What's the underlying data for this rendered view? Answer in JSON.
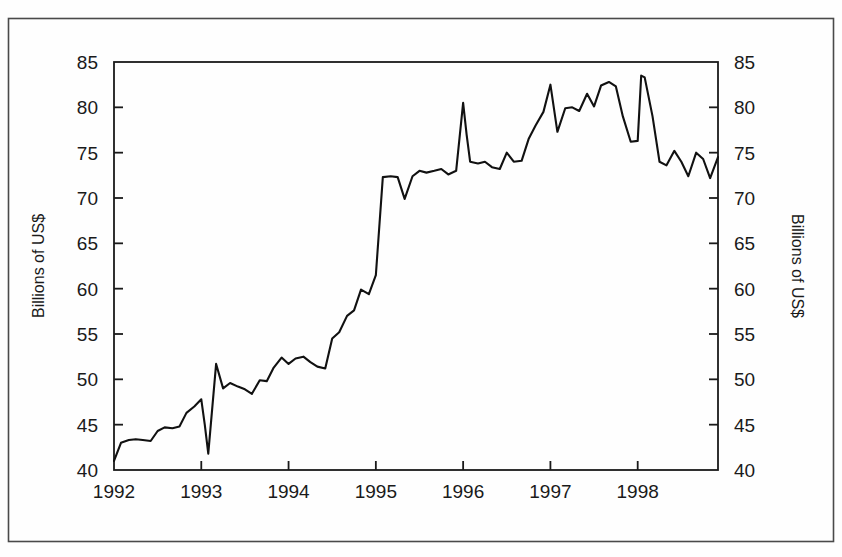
{
  "figure": {
    "name": "line-chart-figure",
    "background_color": "#fefefe",
    "border_color": "#4a4a4a",
    "line_color": "#111111",
    "axis_color": "#1a1a1a"
  },
  "axis_titles": {
    "left": "Billions of US$",
    "right": "Billions of US$"
  },
  "chart_data": {
    "type": "line",
    "title": "",
    "subtitle": "",
    "xlabel": "",
    "ylabel": "Billions of US$",
    "ylabel_right": "Billions of US$",
    "xlim": [
      1992.0,
      1998.92
    ],
    "ylim": [
      40,
      85
    ],
    "grid": false,
    "legend": null,
    "legend_position": "none",
    "y_ticks": [
      40,
      45,
      50,
      55,
      60,
      65,
      70,
      75,
      80,
      85
    ],
    "y_tick_labels": [
      "40",
      "45",
      "50",
      "55",
      "60",
      "65",
      "70",
      "75",
      "80",
      "85"
    ],
    "y_ticks_both_sides": true,
    "x_ticks": [
      1992,
      1993,
      1994,
      1995,
      1996,
      1997,
      1998
    ],
    "x_tick_labels": [
      "1992",
      "1993",
      "1994",
      "1995",
      "1996",
      "1997",
      "1998"
    ],
    "x_minor_ticks": false,
    "series": [
      {
        "name": "Billions of US$",
        "x": [
          1992.0,
          1992.08,
          1992.17,
          1992.25,
          1992.33,
          1992.42,
          1992.5,
          1992.58,
          1992.67,
          1992.75,
          1992.83,
          1992.92,
          1993.0,
          1993.04,
          1993.08,
          1993.17,
          1993.25,
          1993.33,
          1993.42,
          1993.5,
          1993.58,
          1993.67,
          1993.75,
          1993.83,
          1993.92,
          1994.0,
          1994.08,
          1994.17,
          1994.25,
          1994.33,
          1994.42,
          1994.5,
          1994.58,
          1994.67,
          1994.75,
          1994.83,
          1994.92,
          1995.0,
          1995.08,
          1995.17,
          1995.25,
          1995.33,
          1995.42,
          1995.5,
          1995.58,
          1995.67,
          1995.75,
          1995.83,
          1995.92,
          1996.0,
          1996.04,
          1996.08,
          1996.17,
          1996.25,
          1996.33,
          1996.42,
          1996.5,
          1996.58,
          1996.67,
          1996.75,
          1996.83,
          1996.92,
          1997.0,
          1997.08,
          1997.17,
          1997.25,
          1997.33,
          1997.42,
          1997.5,
          1997.58,
          1997.67,
          1997.75,
          1997.83,
          1997.92,
          1998.0,
          1998.04,
          1998.08,
          1998.17,
          1998.25,
          1998.33,
          1998.42,
          1998.5,
          1998.58,
          1998.67,
          1998.75,
          1998.83,
          1998.92
        ],
        "values": [
          41.0,
          43.0,
          43.3,
          43.4,
          43.3,
          43.2,
          44.3,
          44.7,
          44.6,
          44.8,
          46.3,
          47.0,
          47.8,
          45.0,
          41.8,
          51.7,
          49.0,
          49.6,
          49.2,
          48.9,
          48.4,
          49.9,
          49.8,
          51.3,
          52.4,
          51.7,
          52.3,
          52.5,
          51.9,
          51.4,
          51.2,
          54.5,
          55.2,
          57.0,
          57.6,
          59.9,
          59.4,
          61.5,
          72.3,
          72.4,
          72.3,
          69.9,
          72.4,
          73.0,
          72.8,
          73.0,
          73.2,
          72.6,
          73.0,
          80.5,
          77.0,
          74.0,
          73.8,
          74.0,
          73.4,
          73.2,
          75.0,
          74.0,
          74.1,
          76.5,
          78.0,
          79.5,
          82.5,
          77.3,
          79.9,
          80.0,
          79.6,
          81.5,
          80.1,
          82.4,
          82.8,
          82.3,
          79.0,
          76.2,
          76.3,
          83.5,
          83.3,
          79.0,
          74.0,
          73.6,
          75.2,
          74.0,
          72.4,
          75.0,
          74.3,
          72.2,
          74.5
        ]
      }
    ]
  }
}
